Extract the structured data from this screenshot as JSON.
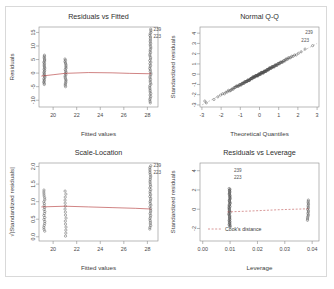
{
  "figure": {
    "background": "#ffffff",
    "frame_color": "#d9d9d9",
    "point_color": "#4d4d4d",
    "smooth_color": "#b03030",
    "axis_color": "#8a8a8a"
  },
  "chart_data": [
    {
      "id": "residuals-vs-fitted",
      "type": "scatter",
      "title": "Residuals vs Fitted",
      "xlabel": "Fitted values",
      "ylabel": "Residuals",
      "xlim": [
        18.8,
        28.9
      ],
      "ylim": [
        -12.5,
        17.0
      ],
      "xticks": [
        20,
        22,
        24,
        26,
        28
      ],
      "xticklabels": [
        "20",
        "22",
        "24",
        "26",
        "28"
      ],
      "yticks": [
        -10,
        -5,
        0,
        5,
        10,
        15
      ],
      "yticklabels": [
        "-10",
        "-5",
        "0",
        "5",
        "10",
        "15"
      ],
      "grid": false,
      "legend": "none",
      "clusters": [
        {
          "x": 19.25,
          "n": 26,
          "ymin": -4.2,
          "ymax": 6.6
        },
        {
          "x": 21.05,
          "n": 22,
          "ymin": -5.0,
          "ymax": 5.2
        },
        {
          "x": 28.25,
          "n": 48,
          "ymin": -11.0,
          "ymax": 16.2
        }
      ],
      "smooth": [
        {
          "x": 19.0,
          "y": -1.1
        },
        {
          "x": 20.0,
          "y": -0.6
        },
        {
          "x": 21.0,
          "y": -0.1
        },
        {
          "x": 23.0,
          "y": 0.2
        },
        {
          "x": 25.0,
          "y": 0.1
        },
        {
          "x": 26.5,
          "y": -0.1
        },
        {
          "x": 28.3,
          "y": -0.25
        }
      ],
      "annotations": [
        {
          "label": "239",
          "x": 28.3,
          "y": 16.2
        },
        {
          "label": "223",
          "x": 28.3,
          "y": 13.4
        }
      ]
    },
    {
      "id": "normal-qq",
      "type": "scatter",
      "title": "Normal Q-Q",
      "xlabel": "Theoretical Quantiles",
      "ylabel": "Standardized residuals",
      "xlim": [
        -3.1,
        3.1
      ],
      "ylim": [
        -3.2,
        4.6
      ],
      "xticks": [
        -3,
        -2,
        -1,
        0,
        1,
        2,
        3
      ],
      "xticklabels": [
        "-3",
        "-2",
        "-1",
        "0",
        "1",
        "2",
        "3"
      ],
      "yticks": [
        -3,
        -2,
        -1,
        0,
        1,
        2,
        3,
        4
      ],
      "yticklabels": [
        "-3",
        "-2",
        "-1",
        "0",
        "1",
        "2",
        "3",
        "4"
      ],
      "grid": false,
      "legend": "none",
      "n_points": 150,
      "qq_shape": "s-curve stepped",
      "refline": [
        {
          "x": -3.0,
          "y": -3.0
        },
        {
          "x": 3.0,
          "y": 3.0
        }
      ],
      "annotations": [
        {
          "label": "239",
          "x": 2.25,
          "y": 4.05
        },
        {
          "label": "223",
          "x": 2.05,
          "y": 3.25
        }
      ]
    },
    {
      "id": "scale-location",
      "type": "scatter",
      "title": "Scale-Location",
      "xlabel": "Fitted values",
      "ylabel": "√|Standardized residuals|",
      "xlim": [
        18.8,
        28.9
      ],
      "ylim": [
        -0.12,
        2.1
      ],
      "xticks": [
        20,
        22,
        24,
        26,
        28
      ],
      "xticklabels": [
        "20",
        "22",
        "24",
        "26",
        "28"
      ],
      "yticks": [
        0.0,
        0.5,
        1.0,
        1.5,
        2.0
      ],
      "yticklabels": [
        "0.0",
        "0.5",
        "1.0",
        "1.5",
        "2.0"
      ],
      "grid": false,
      "legend": "none",
      "clusters": [
        {
          "x": 19.25,
          "n": 22,
          "ymin": 0.16,
          "ymax": 1.33
        },
        {
          "x": 21.05,
          "n": 16,
          "ymin": 0.02,
          "ymax": 1.3
        },
        {
          "x": 28.25,
          "n": 38,
          "ymin": 0.22,
          "ymax": 2.02
        }
      ],
      "smooth": [
        {
          "x": 19.0,
          "y": 0.85
        },
        {
          "x": 21.0,
          "y": 0.87
        },
        {
          "x": 23.0,
          "y": 0.85
        },
        {
          "x": 25.0,
          "y": 0.83
        },
        {
          "x": 27.0,
          "y": 0.81
        },
        {
          "x": 28.3,
          "y": 0.79
        }
      ],
      "annotations": [
        {
          "label": "239",
          "x": 28.3,
          "y": 2.02
        },
        {
          "label": "223",
          "x": 28.3,
          "y": 1.84
        }
      ]
    },
    {
      "id": "residuals-vs-leverage",
      "type": "scatter",
      "title": "Residuals vs Leverage",
      "xlabel": "Leverage",
      "ylabel": "Standardized residuals",
      "xlim": [
        -0.001,
        0.0425
      ],
      "ylim": [
        -3.3,
        4.8
      ],
      "xticks": [
        0.0,
        0.01,
        0.02,
        0.03,
        0.04
      ],
      "xticklabels": [
        "0.00",
        "0.01",
        "0.02",
        "0.03",
        "0.04"
      ],
      "yticks": [
        -2,
        0,
        2,
        4
      ],
      "yticklabels": [
        "-2",
        "0",
        "2",
        "4"
      ],
      "grid": false,
      "legend": "Cook's distance",
      "legend_position": "bottom-left",
      "clusters": [
        {
          "x": 0.0098,
          "n": 52,
          "ymin": -1.85,
          "ymax": 2.15
        },
        {
          "x": 0.0385,
          "n": 16,
          "ymin": -1.15,
          "ymax": 0.95
        }
      ],
      "smooth": [
        {
          "x": 0.009,
          "y": -0.28
        },
        {
          "x": 0.018,
          "y": -0.18
        },
        {
          "x": 0.028,
          "y": -0.05
        },
        {
          "x": 0.039,
          "y": 0.05
        }
      ],
      "annotations": [
        {
          "label": "239",
          "x": 0.0105,
          "y": 4.05
        },
        {
          "label": "223",
          "x": 0.0105,
          "y": 3.3
        }
      ]
    }
  ]
}
